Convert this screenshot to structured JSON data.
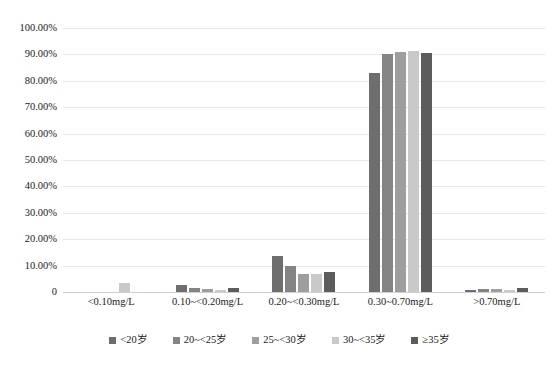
{
  "chart_data": {
    "type": "bar",
    "title": "",
    "xlabel": "",
    "ylabel": "",
    "ylim": [
      0,
      1.0
    ],
    "grid": true,
    "legend_position": "bottom",
    "categories": [
      "<0.10mg/L",
      "0.10~<0.20mg/L",
      "0.20~<0.30mg/L",
      "0.30~0.70mg/L",
      ">0.70mg/L"
    ],
    "ytick_labels": [
      "100.00%",
      "90.00%",
      "80.00%",
      "70.00%",
      "60.00%",
      "50.00%",
      "40.00%",
      "30.00%",
      "20.00%",
      "10.00%",
      "0"
    ],
    "ytick_values": [
      100,
      90,
      80,
      70,
      60,
      50,
      40,
      30,
      20,
      10,
      0
    ],
    "series": [
      {
        "name": "<20岁",
        "color": "#6e6e6e",
        "values": [
          0.0,
          2.8,
          13.6,
          83.0,
          0.9
        ]
      },
      {
        "name": "20~<25岁",
        "color": "#848484",
        "values": [
          0.0,
          1.5,
          9.8,
          90.0,
          1.2
        ]
      },
      {
        "name": "25~<30岁",
        "color": "#9e9e9e",
        "values": [
          0.0,
          1.0,
          6.8,
          91.0,
          1.0
        ]
      },
      {
        "name": "30~<35岁",
        "color": "#c9c9c9",
        "values": [
          3.4,
          0.9,
          6.8,
          91.2,
          0.8
        ]
      },
      {
        "name": "≥35岁",
        "color": "#5c5c5c",
        "values": [
          0.0,
          1.6,
          7.6,
          90.4,
          1.5
        ]
      }
    ]
  }
}
